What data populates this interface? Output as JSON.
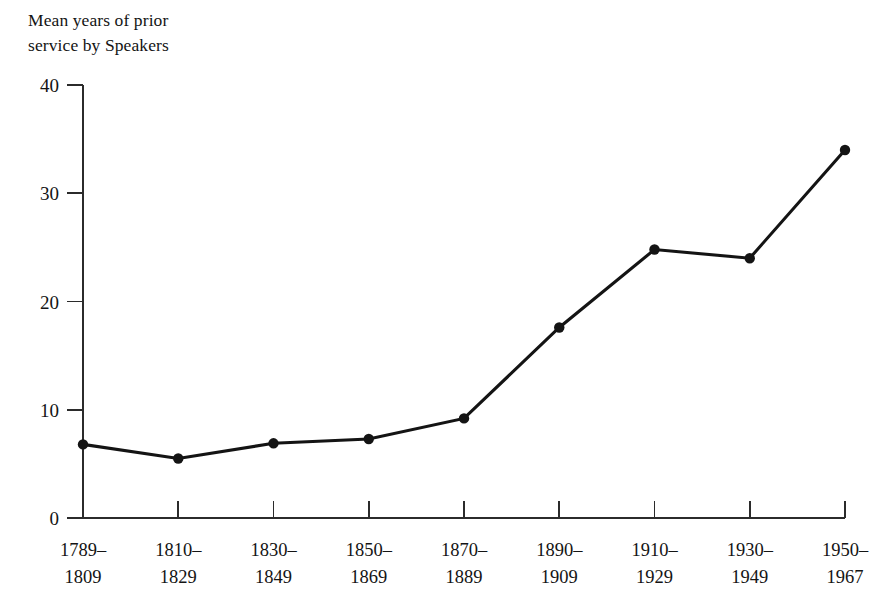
{
  "chart_data": {
    "type": "line",
    "title": "Mean years of prior\nservice by Speakers",
    "xlabel": "",
    "ylabel": "",
    "categories": [
      "1789–\n1809",
      "1810–\n1829",
      "1830–\n1849",
      "1850–\n1869",
      "1870–\n1889",
      "1890–\n1909",
      "1910–\n1929",
      "1930–\n1949",
      "1950–\n1967"
    ],
    "category_lines": [
      [
        "1789–",
        "1809"
      ],
      [
        "1810–",
        "1829"
      ],
      [
        "1830–",
        "1849"
      ],
      [
        "1850–",
        "1869"
      ],
      [
        "1870–",
        "1889"
      ],
      [
        "1890–",
        "1909"
      ],
      [
        "1910–",
        "1929"
      ],
      [
        "1930–",
        "1949"
      ],
      [
        "1950–",
        "1967"
      ]
    ],
    "values": [
      6.8,
      5.5,
      6.9,
      7.3,
      9.2,
      17.6,
      24.8,
      24.0,
      34.0
    ],
    "ylim": [
      0,
      40
    ],
    "yticks": [
      0,
      10,
      20,
      30,
      40
    ],
    "ytick_labels": [
      "0",
      "10",
      "20",
      "30",
      "40"
    ],
    "grid": false,
    "legend": false,
    "markers": "filled-circle",
    "colors": {
      "line": "#141414",
      "marker": "#141414",
      "axis": "#2b2b2b",
      "text": "#141414",
      "background": "#ffffff"
    }
  }
}
